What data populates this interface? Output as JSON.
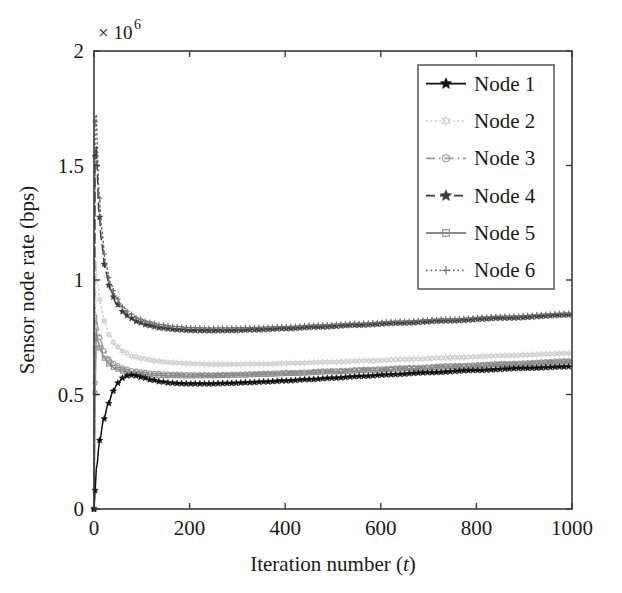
{
  "chart_data": {
    "type": "line",
    "title": "",
    "xlabel": "Iteration number (t)",
    "ylabel": "Sensor node rate (bps)",
    "y_multiplier": "× 10",
    "y_multiplier_exponent": "6",
    "xlim": [
      0,
      1000
    ],
    "ylim": [
      0,
      2
    ],
    "xticks": [
      0,
      200,
      400,
      600,
      800,
      1000
    ],
    "xtick_labels": [
      "0",
      "200",
      "400",
      "600",
      "800",
      "1000"
    ],
    "yticks": [
      0,
      0.5,
      1,
      1.5,
      2
    ],
    "ytick_labels": [
      "0",
      "0.5",
      "1",
      "1.5",
      "2"
    ],
    "grid": false,
    "legend_position": "upper right",
    "series": [
      {
        "name": "Node 1",
        "color": "#111111",
        "linestyle": "solid",
        "marker": "star",
        "x": [
          0,
          5,
          12,
          20,
          30,
          40,
          50,
          60,
          70,
          80,
          90,
          100,
          120,
          140,
          160,
          180,
          200,
          240,
          280,
          320,
          360,
          400,
          450,
          500,
          560,
          620,
          700,
          800,
          900,
          1000
        ],
        "y": [
          0.0,
          0.175,
          0.3,
          0.39,
          0.46,
          0.515,
          0.55,
          0.572,
          0.582,
          0.585,
          0.582,
          0.576,
          0.564,
          0.556,
          0.551,
          0.548,
          0.547,
          0.547,
          0.549,
          0.552,
          0.556,
          0.56,
          0.566,
          0.572,
          0.58,
          0.587,
          0.596,
          0.606,
          0.615,
          0.622
        ]
      },
      {
        "name": "Node 2",
        "color": "#d2d2d2",
        "linestyle": "dotted",
        "marker": "hexagram",
        "x": [
          0,
          4,
          8,
          14,
          22,
          32,
          45,
          60,
          80,
          100,
          130,
          160,
          200,
          250,
          300,
          360,
          420,
          500,
          580,
          660,
          760,
          860,
          1000
        ],
        "y": [
          0.0,
          1.09,
          0.98,
          0.89,
          0.82,
          0.76,
          0.715,
          0.69,
          0.668,
          0.657,
          0.646,
          0.64,
          0.635,
          0.632,
          0.632,
          0.634,
          0.637,
          0.642,
          0.648,
          0.654,
          0.662,
          0.67,
          0.68
        ]
      },
      {
        "name": "Node 3",
        "color": "#9a9a9a",
        "linestyle": "dashdot",
        "marker": "circle",
        "x": [
          0,
          4,
          8,
          14,
          22,
          32,
          45,
          60,
          80,
          100,
          130,
          160,
          200,
          250,
          300,
          360,
          420,
          500,
          580,
          660,
          760,
          860,
          1000
        ],
        "y": [
          0.0,
          0.86,
          0.79,
          0.735,
          0.69,
          0.655,
          0.63,
          0.616,
          0.604,
          0.598,
          0.592,
          0.589,
          0.587,
          0.587,
          0.589,
          0.593,
          0.597,
          0.604,
          0.611,
          0.618,
          0.627,
          0.636,
          0.648
        ]
      },
      {
        "name": "Node 4",
        "color": "#3c3c3c",
        "linestyle": "dashed",
        "marker": "star",
        "x": [
          0,
          3,
          6,
          10,
          16,
          24,
          34,
          46,
          60,
          76,
          94,
          114,
          140,
          170,
          205,
          245,
          290,
          340,
          400,
          470,
          550,
          640,
          740,
          860,
          1000
        ],
        "y": [
          0.0,
          1.73,
          1.5,
          1.31,
          1.16,
          1.04,
          0.96,
          0.9,
          0.862,
          0.834,
          0.815,
          0.802,
          0.791,
          0.784,
          0.78,
          0.779,
          0.78,
          0.783,
          0.788,
          0.795,
          0.803,
          0.812,
          0.822,
          0.834,
          0.848
        ]
      },
      {
        "name": "Node 5",
        "color": "#8a8a8a",
        "linestyle": "solid",
        "marker": "square",
        "x": [
          0,
          4,
          8,
          14,
          22,
          32,
          45,
          60,
          80,
          100,
          130,
          160,
          200,
          250,
          300,
          360,
          420,
          500,
          580,
          660,
          760,
          860,
          1000
        ],
        "y": [
          0.0,
          0.79,
          0.735,
          0.692,
          0.658,
          0.632,
          0.613,
          0.602,
          0.593,
          0.588,
          0.584,
          0.582,
          0.581,
          0.582,
          0.584,
          0.588,
          0.592,
          0.599,
          0.606,
          0.613,
          0.622,
          0.631,
          0.643
        ]
      },
      {
        "name": "Node 6",
        "color": "#6e6e6e",
        "linestyle": "dotted",
        "marker": "plus",
        "x": [
          0,
          3,
          6,
          10,
          16,
          24,
          34,
          46,
          60,
          76,
          94,
          114,
          140,
          170,
          205,
          245,
          290,
          340,
          400,
          470,
          550,
          640,
          740,
          860,
          1000
        ],
        "y": [
          0.0,
          1.9,
          1.62,
          1.4,
          1.22,
          1.08,
          0.99,
          0.925,
          0.882,
          0.852,
          0.831,
          0.817,
          0.805,
          0.797,
          0.792,
          0.79,
          0.791,
          0.793,
          0.797,
          0.804,
          0.811,
          0.82,
          0.83,
          0.842,
          0.856
        ]
      }
    ]
  },
  "axes": {
    "x_title_text": "Iteration number (",
    "x_title_var": "t",
    "x_title_close": ")",
    "y_title": "Sensor node rate (bps)"
  },
  "legend": {
    "entries": [
      {
        "label": "Node 1"
      },
      {
        "label": "Node 2"
      },
      {
        "label": "Node 3"
      },
      {
        "label": "Node 4"
      },
      {
        "label": "Node 5"
      },
      {
        "label": "Node 6"
      }
    ]
  }
}
